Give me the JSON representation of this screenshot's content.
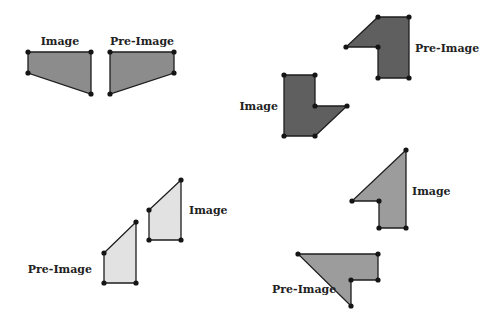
{
  "colors": {
    "stroke": "#1e1e1e",
    "vertex": "#151515",
    "fill_medium": "#8c8c8c",
    "fill_dark": "#5f5f5f",
    "fill_light": "#e2e2e2",
    "fill_gray": "#9c9c9c"
  },
  "figures": [
    {
      "name": "pair-1",
      "image": {
        "label": "Image",
        "points": [
          [
            28,
            52
          ],
          [
            91,
            52
          ],
          [
            91,
            94
          ],
          [
            28,
            73
          ]
        ],
        "fill": "fill_medium",
        "label_pos": [
          60,
          45
        ],
        "anchor": "middle"
      },
      "preimage": {
        "label": "Pre-Image",
        "points": [
          [
            110,
            52
          ],
          [
            174,
            52
          ],
          [
            174,
            73
          ],
          [
            110,
            94
          ]
        ],
        "fill": "fill_medium",
        "label_pos": [
          142,
          45
        ],
        "anchor": "middle"
      }
    },
    {
      "name": "pair-2",
      "image": {
        "label": "Image",
        "points": [
          [
            284,
            75
          ],
          [
            315,
            75
          ],
          [
            315,
            106
          ],
          [
            347,
            106
          ],
          [
            315,
            136
          ],
          [
            284,
            136
          ]
        ],
        "fill": "fill_dark",
        "label_pos": [
          278,
          110
        ],
        "anchor": "end"
      },
      "preimage": {
        "label": "Pre-Image",
        "points": [
          [
            378,
            17
          ],
          [
            409,
            17
          ],
          [
            409,
            78
          ],
          [
            378,
            78
          ],
          [
            378,
            47
          ],
          [
            346,
            47
          ]
        ],
        "fill": "fill_dark",
        "label_pos": [
          415,
          52
        ],
        "anchor": "start"
      }
    },
    {
      "name": "pair-3",
      "image": {
        "label": "Image",
        "points": [
          [
            149,
            210
          ],
          [
            181,
            180
          ],
          [
            181,
            240
          ],
          [
            149,
            240
          ]
        ],
        "fill": "fill_light",
        "label_pos": [
          189,
          214
        ],
        "anchor": "start"
      },
      "preimage": {
        "label": "Pre-Image",
        "points": [
          [
            104,
            253
          ],
          [
            136,
            222
          ],
          [
            136,
            283
          ],
          [
            104,
            283
          ]
        ],
        "fill": "fill_light",
        "label_pos": [
          92,
          273
        ],
        "anchor": "end"
      }
    },
    {
      "name": "pair-4",
      "image": {
        "label": "Image",
        "points": [
          [
            406,
            150
          ],
          [
            406,
            228
          ],
          [
            379,
            228
          ],
          [
            379,
            201
          ],
          [
            352,
            201
          ]
        ],
        "fill": "fill_gray",
        "label_pos": [
          412,
          195
        ],
        "anchor": "start"
      },
      "preimage": {
        "label": "Pre-Image",
        "points": [
          [
            298,
            254
          ],
          [
            378,
            254
          ],
          [
            378,
            280
          ],
          [
            351,
            280
          ],
          [
            351,
            306
          ]
        ],
        "fill": "fill_gray",
        "label_pos": [
          272,
          293
        ],
        "anchor": "start"
      }
    }
  ]
}
